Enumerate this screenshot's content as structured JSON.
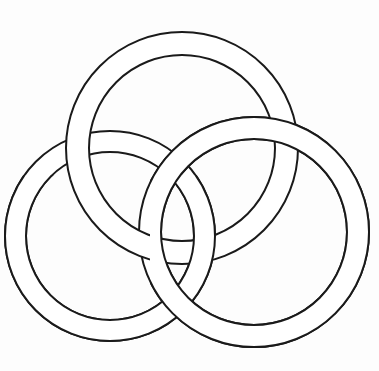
{
  "figure": {
    "background": "#fdfdfd",
    "stroke": "#1a1a1a",
    "band_fill": "#ffffff",
    "rings": [
      {
        "name": "top-ring",
        "cx": 182,
        "cy": 148,
        "r_outer": 116,
        "r_inner": 93
      },
      {
        "name": "left-ring",
        "cx": 110,
        "cy": 236,
        "r_outer": 105,
        "r_inner": 84
      },
      {
        "name": "right-ring",
        "cx": 254,
        "cy": 232,
        "r_outer": 115,
        "r_inner": 93
      }
    ]
  }
}
